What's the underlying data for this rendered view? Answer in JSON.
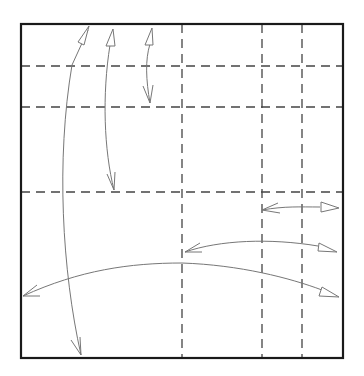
{
  "diagram": {
    "type": "origami-fold-diagram",
    "colors": {
      "border": "#1a1a1a",
      "crease": "#444444",
      "arrow": "#666666",
      "background": "#ffffff"
    },
    "square": {
      "x": 21,
      "y": 24,
      "width": 322,
      "height": 334
    },
    "dashed_verticals": [
      182,
      262,
      302
    ],
    "dashed_horizontals": [
      66,
      107,
      192
    ],
    "arrows": [
      {
        "name": "arrow-left-long-vertical",
        "d": "M80 355 C 60 250, 55 120, 90 28"
      },
      {
        "name": "arrow-mid-vertical",
        "d": "M113 190 C 100 140, 100 80, 113 30"
      },
      {
        "name": "arrow-short-vertical",
        "d": "M150 100 C 145 80, 145 50, 152 28"
      },
      {
        "name": "arrow-short-horizontal",
        "d": "M262 210 C 290 205, 310 207, 340 208"
      },
      {
        "name": "arrow-mid-horizontal",
        "d": "M185 252 C 230 238, 290 238, 336 250"
      },
      {
        "name": "arrow-long-horizontal",
        "d": "M23 296 C 120 255, 230 255, 338 296"
      }
    ]
  }
}
